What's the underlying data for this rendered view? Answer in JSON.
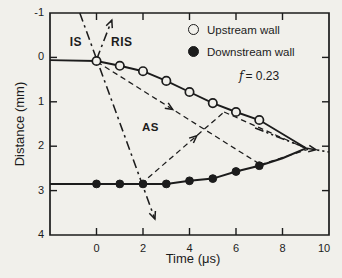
{
  "figure": {
    "background": "#f1f0eb",
    "ink": "#1c1c1c"
  },
  "labels": {
    "xlabel": "Time (μs)",
    "ylabel": "Distance (mm)",
    "is": "IS",
    "ris": "RIS",
    "as": "AS",
    "f_symbol": "f",
    "f_value": "= 0.23",
    "legend": [
      {
        "marker": "open-circle",
        "label": "Upstream wall"
      },
      {
        "marker": "filled-circle",
        "label": "Downstream wall"
      }
    ]
  },
  "chart_data": {
    "type": "scatter",
    "title": "",
    "xlabel": "Time (μs)",
    "ylabel": "Distance (mm)",
    "xlim": [
      -2,
      10
    ],
    "ylim": [
      -1,
      4
    ],
    "y_inverted_axis": "distance increases downward",
    "grid": false,
    "legend_position": "top-right inside",
    "x_tick_values": [
      0,
      2,
      4,
      6,
      8,
      10
    ],
    "x_tick_labels": [
      "0",
      "2",
      "4",
      "6",
      "8",
      "10"
    ],
    "x_minor_tick_values": [
      0,
      2,
      4,
      6,
      8
    ],
    "y_tick_values": [
      -1,
      0,
      1,
      2,
      3,
      4
    ],
    "y_tick_labels": [
      "-1",
      "0",
      "1",
      "2",
      "3",
      "4"
    ],
    "y_side_tick_values": [
      0,
      1,
      2,
      3
    ],
    "annotations": [
      {
        "text": "IS",
        "x": -1.2,
        "y": -0.45
      },
      {
        "text": "RIS",
        "x": 0.8,
        "y": -0.45
      },
      {
        "text": "AS",
        "x": 2.1,
        "y": 1.6
      },
      {
        "text": "f = 0.23",
        "x": 6.5,
        "y": 0.42
      }
    ],
    "series": [
      {
        "name": "Upstream wall",
        "marker": "open-circle",
        "x": [
          0,
          1,
          2,
          3,
          4,
          5,
          6,
          7
        ],
        "y": [
          0.08,
          0.19,
          0.31,
          0.53,
          0.78,
          1.03,
          1.23,
          1.41
        ],
        "line_start": [
          -2.0,
          0.06
        ],
        "line_extend_to": [
          9.0,
          2.04
        ]
      },
      {
        "name": "Downstream wall",
        "marker": "filled-circle",
        "x": [
          0,
          1,
          2,
          3,
          4,
          5,
          6,
          7
        ],
        "y": [
          2.85,
          2.85,
          2.85,
          2.85,
          2.78,
          2.73,
          2.57,
          2.44
        ],
        "line_path": [
          [
            -2.0,
            2.85
          ],
          [
            3.0,
            2.85
          ],
          [
            4,
            2.78
          ],
          [
            5,
            2.73
          ],
          [
            6,
            2.57
          ],
          [
            7,
            2.44
          ],
          [
            8,
            2.27
          ],
          [
            9.0,
            2.05
          ]
        ]
      }
    ],
    "aux_lines": [
      {
        "name": "incident-transmitted-shock-line",
        "style": "dashdot",
        "pts": [
          [
            -0.72,
            -1.0
          ],
          [
            2.51,
            3.64
          ]
        ],
        "arrow_end": true
      },
      {
        "name": "reflected-shock-line",
        "style": "dashdot",
        "pts": [
          [
            0.01,
            0.04
          ],
          [
            0.66,
            -0.84
          ]
        ],
        "arrow_end": true
      },
      {
        "name": "as-wave-downstream-leg",
        "style": "dashed",
        "pts": [
          [
            0.02,
            0.1
          ],
          [
            6.95,
            2.38
          ]
        ],
        "arrow_frac": 0.47
      },
      {
        "name": "as-wave-upstream-leg",
        "style": "dashed",
        "pts": [
          [
            1.92,
            2.85
          ],
          [
            5.49,
            1.23
          ]
        ],
        "arrow_frac": 0.67
      },
      {
        "name": "as-wave-downstream-leg-2",
        "style": "dashed",
        "pts": [
          [
            5.49,
            1.23
          ],
          [
            9.0,
            2.05
          ]
        ]
      },
      {
        "name": "as-wave-upstream-leg-2",
        "style": "dashed",
        "pts": [
          [
            7.04,
            2.42
          ],
          [
            9.1,
            2.07
          ]
        ]
      },
      {
        "name": "convergence-lead-line",
        "style": "dashdotdot",
        "pts": [
          [
            6.82,
            1.59
          ],
          [
            9.02,
            2.04
          ]
        ]
      },
      {
        "name": "convergence-exit-line",
        "style": "dashdotdot",
        "pts": [
          [
            8.98,
            2.04
          ],
          [
            10.0,
            2.13
          ]
        ],
        "arrow_frac": 0.45
      }
    ]
  }
}
